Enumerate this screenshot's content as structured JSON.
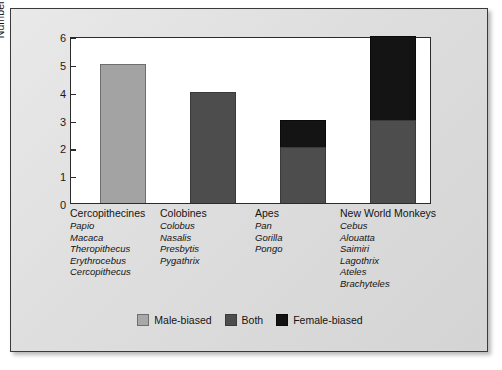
{
  "chart_data": {
    "type": "bar",
    "stacked": true,
    "title": "",
    "xlabel": "",
    "ylabel": "Number of Genera",
    "ylim": [
      0,
      6
    ],
    "yticks": [
      0,
      1,
      2,
      3,
      4,
      5,
      6
    ],
    "grid": false,
    "legend_position": "bottom-center",
    "categories": [
      "Cercopithecines",
      "Colobines",
      "Apes",
      "New World Monkeys"
    ],
    "series": [
      {
        "name": "Male-biased",
        "color": "#a3a3a3",
        "values": [
          5,
          0,
          0,
          0
        ]
      },
      {
        "name": "Both",
        "color": "#4d4d4d",
        "values": [
          0,
          4,
          2,
          3
        ]
      },
      {
        "name": "Female-biased",
        "color": "#141414",
        "values": [
          0,
          0,
          1,
          3
        ]
      }
    ],
    "totals": [
      5,
      4,
      3,
      6
    ]
  },
  "axis": {
    "y_title": "Number of Genera",
    "y_ticks": [
      "6",
      "5",
      "4",
      "3",
      "2",
      "1",
      "0"
    ]
  },
  "groups": [
    {
      "title": "Cercopithecines",
      "genera": [
        "Papio",
        "Macaca",
        "Theropithecus",
        "Erythrocebus",
        "Cercopithecus"
      ]
    },
    {
      "title": "Colobines",
      "genera": [
        "Colobus",
        "Nasalis",
        "Presbytis",
        "Pygathrix"
      ]
    },
    {
      "title": "Apes",
      "genera": [
        "Pan",
        "Gorilla",
        "Pongo"
      ]
    },
    {
      "title": "New World Monkeys",
      "genera": [
        "Cebus",
        "Alouatta",
        "Saimiri",
        "Lagothrix",
        "Ateles",
        "Brachyteles"
      ]
    }
  ],
  "legend": [
    {
      "label": "Male-biased",
      "color": "#a3a3a3"
    },
    {
      "label": "Both",
      "color": "#4d4d4d"
    },
    {
      "label": "Female-biased",
      "color": "#141414"
    }
  ]
}
